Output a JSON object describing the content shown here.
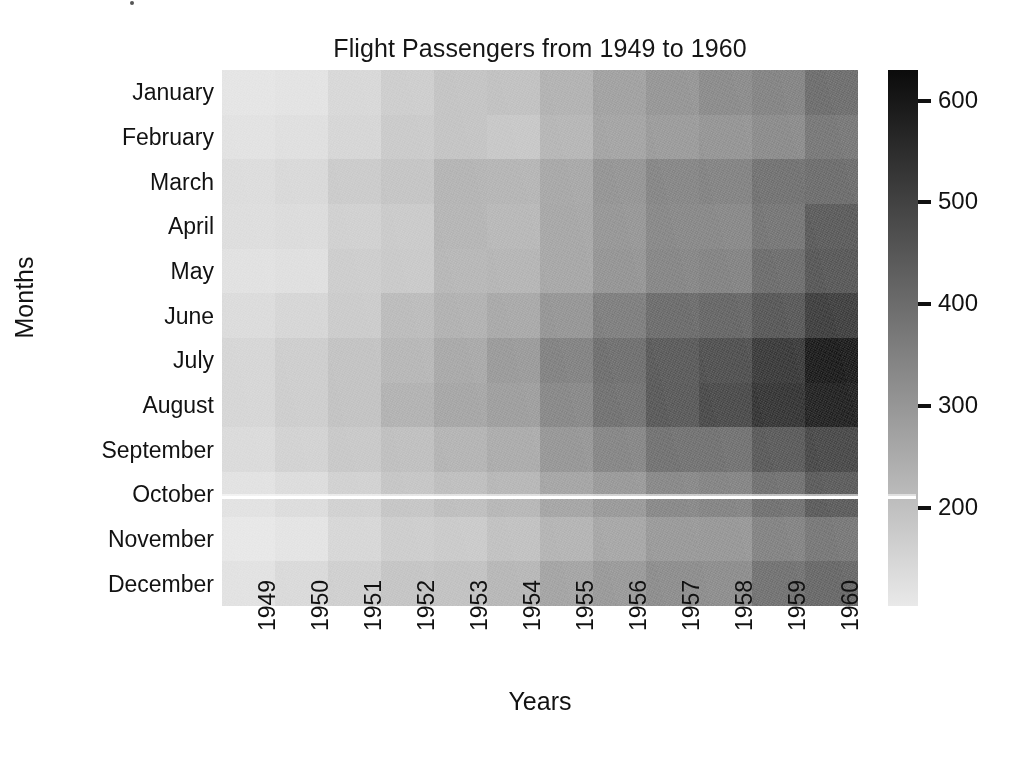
{
  "figure": {
    "title": "Flight Passengers from 1949 to 1960",
    "background_color": "#ffffff",
    "text_color": "#121212"
  },
  "axes": {
    "x_axis_title": "Years",
    "y_axis_title": "Months",
    "x_tick_labels": [
      "1949",
      "1950",
      "1951",
      "1952",
      "1953",
      "1954",
      "1955",
      "1956",
      "1957",
      "1958",
      "1959",
      "1960"
    ],
    "y_tick_labels": [
      "January",
      "February",
      "March",
      "April",
      "May",
      "June",
      "July",
      "August",
      "September",
      "October",
      "November",
      "December"
    ]
  },
  "colorbar": {
    "tick_labels": [
      "600",
      "500",
      "400",
      "300",
      "200"
    ],
    "tick_values": [
      600,
      500,
      400,
      300,
      200
    ],
    "vmin": 104,
    "vmax": 630,
    "low_color": "#e9e9e9",
    "high_color": "#0b0b0b",
    "colormap": "Greys"
  },
  "chart_data": {
    "type": "heatmap",
    "title": "Flight Passengers from 1949 to 1960",
    "xlabel": "Years",
    "ylabel": "Months",
    "x_labels": [
      "1949",
      "1950",
      "1951",
      "1952",
      "1953",
      "1954",
      "1955",
      "1956",
      "1957",
      "1958",
      "1959",
      "1960"
    ],
    "y_labels": [
      "January",
      "February",
      "March",
      "April",
      "May",
      "June",
      "July",
      "August",
      "September",
      "October",
      "November",
      "December"
    ],
    "colormap": "Greys",
    "cbar_ticks": [
      200,
      300,
      400,
      500,
      600
    ],
    "zmin": 104,
    "zmax": 622,
    "grid": false,
    "legend_position": "right",
    "annotations": "none",
    "values": [
      [
        112,
        115,
        145,
        171,
        196,
        204,
        242,
        284,
        315,
        340,
        360,
        417
      ],
      [
        118,
        126,
        150,
        180,
        196,
        188,
        233,
        277,
        301,
        318,
        342,
        391
      ],
      [
        132,
        141,
        178,
        193,
        236,
        235,
        267,
        317,
        356,
        362,
        406,
        419
      ],
      [
        129,
        135,
        163,
        181,
        235,
        227,
        269,
        313,
        348,
        348,
        396,
        461
      ],
      [
        121,
        125,
        172,
        183,
        229,
        234,
        270,
        318,
        355,
        363,
        420,
        472
      ],
      [
        135,
        149,
        178,
        218,
        243,
        264,
        315,
        374,
        422,
        435,
        472,
        535
      ],
      [
        148,
        170,
        199,
        230,
        264,
        302,
        364,
        413,
        465,
        491,
        548,
        622
      ],
      [
        148,
        170,
        199,
        242,
        272,
        293,
        347,
        405,
        467,
        505,
        559,
        606
      ],
      [
        136,
        158,
        184,
        209,
        237,
        259,
        312,
        355,
        404,
        404,
        463,
        508
      ],
      [
        119,
        133,
        162,
        191,
        211,
        229,
        274,
        306,
        347,
        359,
        407,
        461
      ],
      [
        104,
        114,
        146,
        172,
        180,
        203,
        237,
        271,
        305,
        310,
        362,
        390
      ],
      [
        118,
        140,
        166,
        194,
        201,
        229,
        278,
        306,
        336,
        337,
        405,
        432
      ]
    ]
  }
}
